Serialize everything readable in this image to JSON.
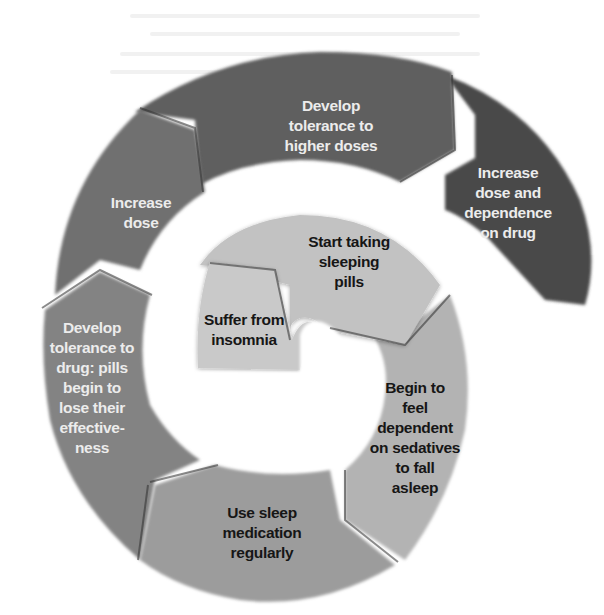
{
  "diagram": {
    "type": "spiral-cycle",
    "direction": "clockwise-outward",
    "steps": [
      {
        "id": 1,
        "text": "Suffer from\ninsomnia",
        "fill": "#c9c9c9",
        "text_color": "#161616"
      },
      {
        "id": 2,
        "text": "Start taking\nsleeping\npills",
        "fill": "#c2c2c2",
        "text_color": "#161616"
      },
      {
        "id": 3,
        "text": "Begin to\nfeel\ndependent\non sedatives\nto fall\nasleep",
        "fill": "#b3b3b3",
        "text_color": "#161616"
      },
      {
        "id": 4,
        "text": "Use sleep\nmedication\nregularly",
        "fill": "#9c9c9c",
        "text_color": "#161616"
      },
      {
        "id": 5,
        "text": "Develop\ntolerance to\ndrug: pills\nbegin to\nlose their\neffective-\nness",
        "fill": "#838383",
        "text_color": "#efefef"
      },
      {
        "id": 6,
        "text": "Increase\ndose",
        "fill": "#707070",
        "text_color": "#efefef"
      },
      {
        "id": 7,
        "text": "Develop\ntolerance to\nhigher doses",
        "fill": "#5e5e5e",
        "text_color": "#efefef"
      },
      {
        "id": 8,
        "text": "Increase\ndose and\ndependence\non drug",
        "fill": "#4a4a4a",
        "text_color": "#efefef"
      }
    ]
  }
}
